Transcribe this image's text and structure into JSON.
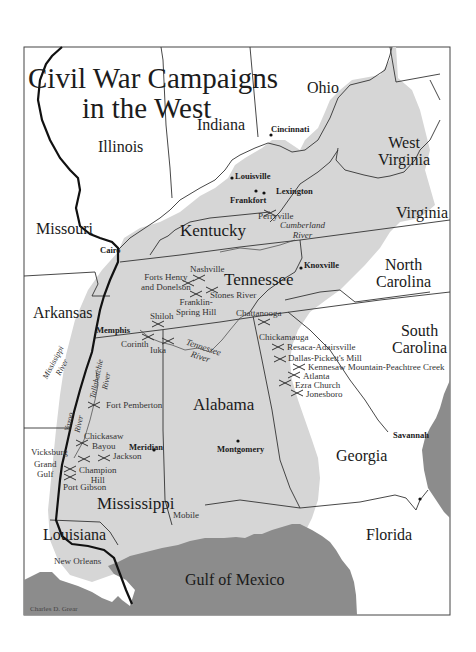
{
  "map": {
    "title_line1": "Civil War Campaigns",
    "title_line2": "in the West",
    "credit": "Charles D. Grear",
    "colors": {
      "background": "#ffffff",
      "campaign_region": "#d6d6d6",
      "water": "#8c8c8c",
      "border": "#333333",
      "mississippi": "#111111"
    },
    "states": {
      "ohio": "Ohio",
      "indiana": "Indiana",
      "illinois": "Illinois",
      "west_virginia_1": "West",
      "west_virginia_2": "Virginia",
      "virginia": "Virginia",
      "kentucky": "Kentucky",
      "missouri": "Missouri",
      "tennessee": "Tennessee",
      "north_carolina_1": "North",
      "north_carolina_2": "Carolina",
      "arkansas": "Arkansas",
      "south_carolina_1": "South",
      "south_carolina_2": "Carolina",
      "alabama": "Alabama",
      "georgia": "Georgia",
      "mississippi": "Mississippi",
      "louisiana": "Louisiana",
      "florida": "Florida"
    },
    "water": {
      "gulf": "Gulf of Mexico"
    },
    "cities": {
      "cincinnati": "Cincinnati",
      "louisville": "Louisville",
      "lexington": "Lexington",
      "frankfort": "Frankfort",
      "cairo": "Cairo",
      "knoxville": "Knoxville",
      "memphis": "Memphis",
      "chattanooga": "Chattanooga",
      "meridian": "Meridian",
      "montgomery": "Montgomery",
      "savannah": "Savannah",
      "vicksburg": "Vicksburg",
      "mobile": "Mobile",
      "new_orleans": "New Orleans"
    },
    "battles": {
      "perryville": "Perryville",
      "nashville": "Nashville",
      "forts_henry_1": "Forts Henry",
      "forts_henry_2": "and Donelson",
      "stones_river": "Stones River",
      "franklin_1": "Franklin-",
      "franklin_2": "Spring Hill",
      "shiloh": "Shiloh",
      "corinth": "Corinth",
      "iuka": "Iuka",
      "chickamauga": "Chickamauga",
      "resaca": "Resaca-Adairsville",
      "dallas": "Dallas-Pickett's Mill",
      "kennesaw": "Kennesaw Mountain-Peachtree Creek",
      "atlanta": "Atlanta",
      "ezra_church": "Ezra Church",
      "jonesboro": "Jonesboro",
      "fort_pemberton": "Fort Pemberton",
      "chickasaw_1": "Chickasaw",
      "chickasaw_2": "Bayou",
      "jackson": "Jackson",
      "grand_gulf_1": "Grand",
      "grand_gulf_2": "Gulf",
      "champion_1": "Champion",
      "champion_2": "Hill",
      "port_gibson": "Port Gibson"
    },
    "rivers": {
      "cumberland_1": "Cumberland",
      "cumberland_2": "River",
      "tennessee_1": "Tennessee",
      "tennessee_2": "River",
      "mississippi_1": "Mississippi",
      "mississippi_2": "River",
      "tallahatchie_1": "Tallahatchie",
      "tallahatchie_2": "River",
      "yazoo_1": "Yazoo",
      "yazoo_2": "River"
    }
  }
}
